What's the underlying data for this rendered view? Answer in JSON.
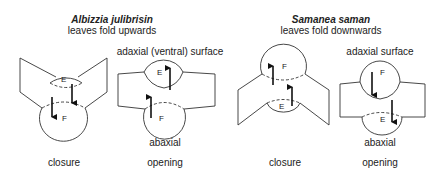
{
  "left": {
    "species": "Albizzia julibrisin",
    "subtitle": "leaves fold upwards",
    "surface_top": "adaxial (ventral) surface",
    "surface_bottom": "abaxial",
    "states": [
      "closure",
      "opening"
    ],
    "motor_labels": {
      "upper": "E",
      "lower": "F"
    }
  },
  "right": {
    "species": "Samanea saman",
    "subtitle": "leaves fold downwards",
    "surface_top": "adaxial surface",
    "surface_bottom": "abaxial",
    "states": [
      "closure",
      "opening"
    ],
    "motor_labels": {
      "upper": "F",
      "lower": "E"
    }
  }
}
